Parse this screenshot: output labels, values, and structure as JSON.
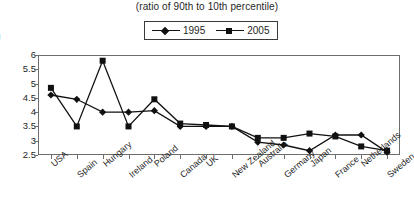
{
  "chart_data": {
    "type": "line",
    "title": "(ratio of 90th to 10th percentile)",
    "xlabel": "",
    "ylabel": "",
    "ylim": [
      2.5,
      6
    ],
    "yticks": [
      2.5,
      3,
      3.5,
      4,
      4.5,
      5,
      5.5,
      6
    ],
    "ytick_labels": [
      "2.5",
      "3",
      "3.5",
      "4",
      "4.5",
      "5",
      "5.5",
      "6"
    ],
    "grid": false,
    "legend_position": "top-center",
    "categories": [
      "USA",
      "Spain",
      "Hungary",
      "Ireland",
      "Poland",
      "Canada",
      "UK",
      "New Zealand",
      "Australia",
      "Germany",
      "Japan",
      "France",
      "Netherlands",
      "Sweden"
    ],
    "series": [
      {
        "name": "1995",
        "marker": "diamond",
        "color": "#111111",
        "values": [
          4.6,
          4.45,
          4.0,
          4.0,
          4.05,
          3.5,
          3.5,
          3.5,
          2.95,
          2.85,
          2.65,
          3.2,
          3.2,
          2.6
        ]
      },
      {
        "name": "2005",
        "marker": "square",
        "color": "#111111",
        "values": [
          4.85,
          3.5,
          5.8,
          3.5,
          4.45,
          3.6,
          3.55,
          3.5,
          3.1,
          3.1,
          3.25,
          3.15,
          2.8,
          2.65
        ]
      }
    ]
  },
  "legend": {
    "entries": [
      {
        "label": "1995"
      },
      {
        "label": "2005"
      }
    ]
  },
  "edge_artifact": {
    "glyph": ")"
  }
}
